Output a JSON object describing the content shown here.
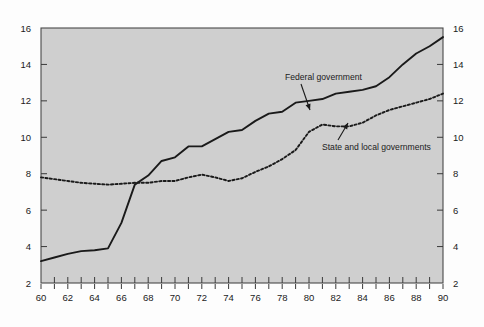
{
  "chart_data": {
    "type": "line",
    "title": "",
    "subtitle": "",
    "xlabel": "",
    "ylabel": "",
    "xlim": [
      60,
      90
    ],
    "ylim": [
      2,
      16
    ],
    "grid": false,
    "legend_position": "inline-annotations",
    "x": [
      60,
      61,
      62,
      63,
      64,
      65,
      66,
      67,
      68,
      69,
      70,
      71,
      72,
      73,
      74,
      75,
      76,
      77,
      78,
      79,
      80,
      81,
      82,
      83,
      84,
      85,
      86,
      87,
      88,
      89,
      90
    ],
    "x_tick_labels": [
      "60",
      "62",
      "64",
      "66",
      "68",
      "70",
      "72",
      "74",
      "76",
      "78",
      "80",
      "82",
      "84",
      "86",
      "88",
      "90"
    ],
    "y_tick_labels": [
      "2",
      "4",
      "6",
      "8",
      "10",
      "12",
      "14",
      "16"
    ],
    "y_axis_left_labels": [
      "16",
      "14",
      "12",
      "10",
      "8",
      "6",
      "4",
      "2"
    ],
    "y_axis_right_labels": [
      "16",
      "14",
      "12",
      "10",
      "8",
      "6",
      "4",
      "2"
    ],
    "series": [
      {
        "name": "Federal government",
        "style": "solid",
        "color": "#1a1a1a",
        "values": [
          3.2,
          3.4,
          3.6,
          3.75,
          3.8,
          3.9,
          5.3,
          7.4,
          7.9,
          8.7,
          8.9,
          9.5,
          9.5,
          9.9,
          10.3,
          10.4,
          10.9,
          11.3,
          11.4,
          11.9,
          12.0,
          12.1,
          12.4,
          12.5,
          12.6,
          12.8,
          13.3,
          14.0,
          14.6,
          15.0,
          15.5
        ],
        "annotation": {
          "label": "Federal government",
          "label_x": 285,
          "label_y": 80,
          "arrow_to_x": 310,
          "arrow_to_y": 110
        }
      },
      {
        "name": "State and local governments",
        "style": "dotted",
        "color": "#1a1a1a",
        "values": [
          7.8,
          7.7,
          7.6,
          7.5,
          7.45,
          7.4,
          7.45,
          7.5,
          7.5,
          7.6,
          7.6,
          7.8,
          7.95,
          7.8,
          7.6,
          7.75,
          8.1,
          8.4,
          8.8,
          9.3,
          10.3,
          10.7,
          10.6,
          10.6,
          10.8,
          11.2,
          11.5,
          11.7,
          11.9,
          12.1,
          12.4
        ],
        "annotation": {
          "label": "State and local governments",
          "label_x": 322,
          "label_y": 150,
          "arrow_to_x": 348,
          "arrow_to_y": 123
        }
      }
    ],
    "colors": {
      "page_background": "#fdfdfd",
      "plot_background": "#cfcfcf",
      "axis": "#4a4a4a",
      "line": "#1a1a1a",
      "text": "#1b1b1b"
    }
  }
}
